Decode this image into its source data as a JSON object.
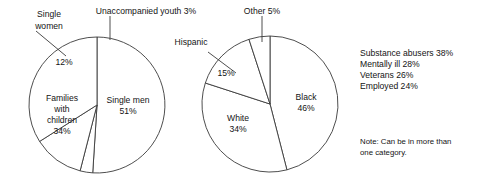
{
  "chart_data": [
    {
      "type": "pie",
      "title": "Homeless population by household type",
      "id": "household-type",
      "center": [
        97,
        105
      ],
      "radius": 68,
      "start_angle_deg": -90,
      "categories": [
        "Single men",
        "Unaccompanied youth",
        "Single women",
        "Families with children"
      ],
      "values": [
        51,
        3,
        12,
        34
      ],
      "slices": [
        {
          "label": "Single men",
          "value": 51,
          "value_label": "51%",
          "label_x": 128,
          "label_y": 103,
          "value_x": 128,
          "value_y": 114,
          "inside": true,
          "leader": null
        },
        {
          "label": "Unaccompanied youth",
          "value": 3,
          "value_label": "3%",
          "label_text": "Unaccompanied youth 3%",
          "label_x": 146,
          "label_y": 12,
          "inside": false,
          "leader": [
            [
              110,
              16
            ],
            [
              110,
              40
            ]
          ]
        },
        {
          "label": "Single women",
          "value": 12,
          "value_label": "12%",
          "label_line1": "Single",
          "label_line2": "women",
          "label_x": 48,
          "label_y": 16,
          "label2_y": 28,
          "value_x": 62,
          "value_y": 62,
          "inside": false,
          "leader": [
            [
              36,
              31
            ],
            [
              66,
              56
            ]
          ]
        },
        {
          "label": "Families with children",
          "value": 34,
          "value_label": "34%",
          "label_lines": [
            "Families",
            "with",
            "children",
            "34%"
          ],
          "label_x": 62,
          "label_y": 104,
          "inside": true,
          "leader": null
        }
      ],
      "xlabel": "",
      "ylabel": "",
      "legend": "none",
      "grid": false
    },
    {
      "type": "pie",
      "title": "Homeless population by race/ethnicity",
      "id": "race-ethnicity",
      "center": [
        270,
        104
      ],
      "radius": 68,
      "start_angle_deg": -90,
      "categories": [
        "Black",
        "White",
        "Hispanic",
        "Other"
      ],
      "values": [
        46,
        34,
        15,
        5
      ],
      "slices": [
        {
          "label": "Black",
          "value": 46,
          "value_label": "46%",
          "label_x": 306,
          "label_y": 100,
          "value_x": 306,
          "value_y": 111,
          "inside": true,
          "leader": null
        },
        {
          "label": "White",
          "value": 34,
          "value_label": "34%",
          "label_x": 238,
          "label_y": 121,
          "value_x": 238,
          "value_y": 132,
          "inside": true,
          "leader": null
        },
        {
          "label": "Hispanic",
          "value": 15,
          "value_label": "15%",
          "label_x": 191,
          "label_y": 42,
          "value_x": 225,
          "value_y": 72,
          "inside": false,
          "leader": [
            [
              208,
              52
            ],
            [
              236,
              73
            ]
          ]
        },
        {
          "label": "Other",
          "value": 5,
          "value_label": "5%",
          "label_text": "Other 5%",
          "label_x": 262,
          "label_y": 12,
          "inside": false,
          "leader": [
            [
              262,
              16
            ],
            [
              262,
              42
            ]
          ]
        }
      ],
      "xlabel": "",
      "ylabel": "",
      "legend": "none",
      "grid": false
    }
  ],
  "stats": {
    "items": [
      {
        "label": "Substance abusers",
        "value_label": "38%",
        "text": "Substance abusers 38%"
      },
      {
        "label": "Mentally ill",
        "value_label": "28%",
        "text": "Mentally ill 28%"
      },
      {
        "label": "Veterans",
        "value_label": "26%",
        "text": "Veterans 26%"
      },
      {
        "label": "Employed",
        "value_label": "24%",
        "text": "Employed 24%"
      }
    ],
    "note_line1": "Note: Can be in more than",
    "note_line2": "one category."
  },
  "colors": {
    "background": "#ffffff",
    "line": "#3a3a3a",
    "text": "#141414"
  }
}
